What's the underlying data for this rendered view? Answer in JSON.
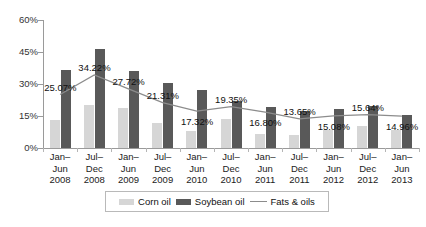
{
  "chart_data": {
    "type": "bar",
    "title": "",
    "subtitle": "",
    "xlabel": "",
    "ylabel": "",
    "ylim": [
      0,
      60
    ],
    "yticks": [
      "0%",
      "15%",
      "30%",
      "45%",
      "60%"
    ],
    "ytick_values": [
      0,
      15,
      30,
      45,
      60
    ],
    "grid": false,
    "legend_position": "bottom",
    "categories": [
      "Jan–Jun 2008",
      "Jul–Dec 2008",
      "Jan–Jun 2009",
      "Jul–Dec 2009",
      "Jan–Jun 2010",
      "Jul–Dec 2010",
      "Jan–Jun 2011",
      "Jul–Dec 2011",
      "Jan–Jun 2012",
      "Jul–Dec 2012",
      "Jan–Jun 2013"
    ],
    "category_lines": [
      [
        "Jan–",
        "Jun",
        "2008"
      ],
      [
        "Jul–",
        "Dec",
        "2008"
      ],
      [
        "Jan–",
        "Jun",
        "2009"
      ],
      [
        "Jul–",
        "Dec",
        "2009"
      ],
      [
        "Jan–",
        "Jun",
        "2010"
      ],
      [
        "Jul–",
        "Dec",
        "2010"
      ],
      [
        "Jan–",
        "Jun",
        "2011"
      ],
      [
        "Jul–",
        "Dec",
        "2011"
      ],
      [
        "Jan–",
        "Jun",
        "2012"
      ],
      [
        "Jul–",
        "Dec",
        "2012"
      ],
      [
        "Jan–",
        "Jun",
        "2013"
      ]
    ],
    "series": [
      {
        "name": "Corn oil",
        "type": "bar",
        "color": "#d6d6d6",
        "values": [
          13.0,
          20.0,
          18.6,
          11.5,
          7.8,
          13.4,
          6.6,
          6.1,
          8.4,
          10.3,
          8.3
        ]
      },
      {
        "name": "Soybean oil",
        "type": "bar",
        "color": "#595959",
        "values": [
          36.6,
          46.5,
          36.0,
          30.5,
          27.2,
          22.2,
          19.2,
          17.2,
          18.2,
          19.8,
          15.6
        ]
      },
      {
        "name": "Fats & oils",
        "type": "line",
        "color": "#8c8c8c",
        "values": [
          25.07,
          34.22,
          27.72,
          21.31,
          17.32,
          19.35,
          16.8,
          13.65,
          15.08,
          15.64,
          14.96
        ],
        "labels": [
          "25.07%",
          "34.22%",
          "27.72%",
          "21.31%",
          "17.32%",
          "19.35%",
          "16.80%",
          "13.65%",
          "15.08%",
          "15.64%",
          "14.96%"
        ]
      }
    ]
  },
  "legend": {
    "items": [
      {
        "label": "Corn oil",
        "marker": "bar-swatch-light"
      },
      {
        "label": "Soybean oil",
        "marker": "bar-swatch-dark"
      },
      {
        "label": "Fats & oils",
        "marker": "line-swatch"
      }
    ]
  }
}
